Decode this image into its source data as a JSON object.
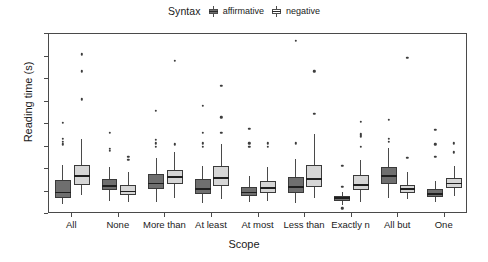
{
  "legend": {
    "title": "Syntax",
    "entries": [
      {
        "label": "affirmative",
        "color": "#6f6f6f",
        "key": "boxplot-key-affirmative"
      },
      {
        "label": "negative",
        "color": "#d6d6d6",
        "key": "boxplot-key-negative"
      }
    ]
  },
  "axes": {
    "ylabel": "Reading time (s)",
    "xlabel": "Scope",
    "yticks": [
      0,
      10,
      20,
      30,
      40,
      50,
      60,
      70,
      80
    ]
  },
  "chart_data": {
    "type": "box",
    "title": "",
    "xlabel": "Scope",
    "ylabel": "Reading time (s)",
    "ylim": [
      0,
      80
    ],
    "grid": false,
    "legend_title": "Syntax",
    "legend_position": "top-center",
    "categories": [
      "All",
      "None",
      "More than",
      "At least",
      "At most",
      "Less than",
      "Exactly n",
      "All but",
      "One"
    ],
    "series": [
      {
        "name": "affirmative",
        "color": "#6f6f6f",
        "boxes": [
          {
            "category": "All",
            "lower_whisker": 4.5,
            "q1": 7.0,
            "median": 9.5,
            "q3": 15.0,
            "upper_whisker": 22.0,
            "outliers": [
              31.0,
              32.0,
              33.5,
              40.5
            ]
          },
          {
            "category": "None",
            "lower_whisker": 6.0,
            "q1": 10.5,
            "median": 12.5,
            "q3": 15.5,
            "upper_whisker": 21.0,
            "outliers": [
              28.0,
              29.0,
              36.0
            ]
          },
          {
            "category": "More than",
            "lower_whisker": 5.5,
            "q1": 11.0,
            "median": 13.5,
            "q3": 18.0,
            "upper_whisker": 25.0,
            "outliers": [
              30.0,
              31.5,
              33.0,
              46.0
            ]
          },
          {
            "category": "At least",
            "lower_whisker": 5.0,
            "q1": 9.0,
            "median": 11.0,
            "q3": 15.5,
            "upper_whisker": 21.5,
            "outliers": [
              30.0,
              31.5,
              36.0,
              48.0
            ]
          },
          {
            "category": "At most",
            "lower_whisker": 5.5,
            "q1": 8.0,
            "median": 9.5,
            "q3": 12.0,
            "upper_whisker": 17.0,
            "outliers": [
              30.0,
              31.5,
              38.0
            ]
          },
          {
            "category": "Less than",
            "lower_whisker": 5.0,
            "q1": 9.5,
            "median": 12.0,
            "q3": 16.5,
            "upper_whisker": 24.5,
            "outliers": [
              31.5,
              77.0
            ]
          },
          {
            "category": "Exactly n",
            "lower_whisker": 4.0,
            "q1": 6.0,
            "median": 7.0,
            "q3": 8.0,
            "upper_whisker": 10.0,
            "outliers": [
              2.5,
              12.0,
              21.5
            ]
          },
          {
            "category": "All but",
            "lower_whisker": 7.0,
            "q1": 13.5,
            "median": 17.0,
            "q3": 21.0,
            "upper_whisker": 29.5,
            "outliers": [
              32.0,
              33.5,
              42.0
            ]
          },
          {
            "category": "One",
            "lower_whisker": 5.5,
            "q1": 7.5,
            "median": 9.0,
            "q3": 11.0,
            "upper_whisker": 14.5,
            "outliers": [
              25.5,
              31.0,
              37.5
            ]
          }
        ]
      },
      {
        "name": "negative",
        "color": "#d6d6d6",
        "boxes": [
          {
            "category": "All",
            "lower_whisker": 8.5,
            "q1": 13.0,
            "median": 17.0,
            "q3": 22.0,
            "upper_whisker": 33.5,
            "outliers": [
              51.0,
              63.5,
              71.0
            ]
          },
          {
            "category": "None",
            "lower_whisker": 5.5,
            "q1": 8.5,
            "median": 10.0,
            "q3": 13.0,
            "upper_whisker": 18.5,
            "outliers": [
              24.0,
              25.5
            ]
          },
          {
            "category": "More than",
            "lower_whisker": 7.0,
            "q1": 13.5,
            "median": 16.5,
            "q3": 19.5,
            "upper_whisker": 27.5,
            "outliers": [
              31.0,
              68.0
            ]
          },
          {
            "category": "At least",
            "lower_whisker": 6.5,
            "q1": 12.5,
            "median": 16.0,
            "q3": 21.5,
            "upper_whisker": 31.0,
            "outliers": [
              36.0,
              43.0,
              57.0
            ]
          },
          {
            "category": "At most",
            "lower_whisker": 6.0,
            "q1": 9.5,
            "median": 11.5,
            "q3": 14.5,
            "upper_whisker": 21.0,
            "outliers": [
              30.0,
              31.5
            ]
          },
          {
            "category": "Less than",
            "lower_whisker": 7.0,
            "q1": 12.0,
            "median": 15.5,
            "q3": 22.0,
            "upper_whisker": 35.5,
            "outliers": [
              44.5,
              63.5
            ]
          },
          {
            "category": "Exactly n",
            "lower_whisker": 5.5,
            "q1": 10.5,
            "median": 13.0,
            "q3": 17.5,
            "upper_whisker": 24.0,
            "outliers": [
              30.0,
              34.5,
              35.5,
              41.0
            ]
          },
          {
            "category": "All but",
            "lower_whisker": 6.5,
            "q1": 9.5,
            "median": 11.0,
            "q3": 13.0,
            "upper_whisker": 18.5,
            "outliers": [
              25.0,
              69.5
            ]
          },
          {
            "category": "One",
            "lower_whisker": 8.0,
            "q1": 11.5,
            "median": 13.5,
            "q3": 16.0,
            "upper_whisker": 21.5,
            "outliers": [
              27.5,
              31.5
            ]
          }
        ]
      }
    ]
  }
}
